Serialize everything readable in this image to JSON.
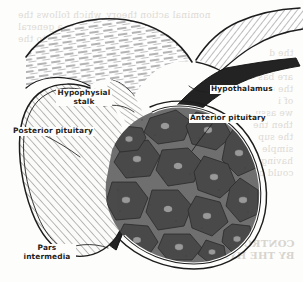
{
  "figure": {
    "type": "anatomical line drawing",
    "width": 303,
    "height": 282,
    "background_color": "#fdfdfc",
    "ink_color": "#1d1d1d"
  },
  "labels": [
    {
      "id": "hypophysial-stalk",
      "text_line1": "Hypophysial",
      "text_line2": "stalk",
      "x": 62,
      "y": 92,
      "align": "center"
    },
    {
      "id": "hypothalamus",
      "text_line1": "Hypothalamus",
      "text_line2": "",
      "x": 208,
      "y": 87,
      "align": "left"
    },
    {
      "id": "posterior-pituitary",
      "text_line1": "Posterior pituitary",
      "text_line2": "",
      "x": 12,
      "y": 128,
      "align": "left"
    },
    {
      "id": "anterior-pituitary",
      "text_line1": "Anterior pituitary",
      "text_line2": "",
      "x": 189,
      "y": 115,
      "align": "left"
    },
    {
      "id": "pars-intermedia",
      "text_line1": "Pars",
      "text_line2": "intermedia",
      "x": 28,
      "y": 249,
      "align": "center"
    }
  ],
  "regions": {
    "hypothalamus_fill": "#fefefe",
    "stalk_fill": "#fefefe",
    "posterior_pituitary_fill": "#fbfbf9",
    "anterior_pituitary_fill": "#6f6f6f",
    "anterior_pituitary_cells": "#4a4a4a",
    "pars_intermedia_fill": "#232323",
    "capsule_outline": "#1d1d1d"
  },
  "bleed_through": {
    "note": "faint mirror-reversed text from reverse of page",
    "color": "#d9d5cf",
    "top_lines": [
      "nominal action theory, which follows the",
      "present the a                 general",
      "to the"
    ],
    "right_lines": [
      "the d",
      "and the",
      "are bas",
      "the con",
      "of i",
      "we assu",
      "then the",
      "the sup",
      "simple",
      "having",
      "could be"
    ],
    "bottom_lines": [
      "CONTROL OF",
      "BY THE HYPOT"
    ]
  }
}
